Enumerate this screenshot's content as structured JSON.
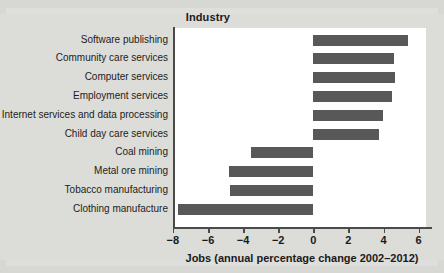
{
  "chart_data": {
    "type": "bar",
    "orientation": "horizontal",
    "title": "Industry",
    "xlabel": "Jobs (annual percentage change 2002–2012)",
    "ylabel": "Industry",
    "categories": [
      "Software publishing",
      "Community care services",
      "Computer services",
      "Employment services",
      "Internet services and data processing",
      "Child day care services",
      "Coal mining",
      "Metal ore mining",
      "Tobacco manufacturing",
      "Clothing manufacture"
    ],
    "values": [
      5.4,
      4.6,
      4.65,
      4.5,
      3.95,
      3.75,
      -3.55,
      -4.8,
      -4.75,
      -7.7
    ],
    "xlim": [
      -8.6,
      6.6
    ],
    "xticks": [
      -8,
      -6,
      -4,
      -2,
      0,
      2,
      4,
      6
    ],
    "xtick_labels": [
      "−8",
      "−6",
      "−4",
      "−2",
      "0",
      "2",
      "4",
      "6"
    ],
    "grid": false,
    "legend": false,
    "bar_color": "#585858",
    "plot_bg": "#ffffff",
    "page_bg": "#d7d7d4"
  }
}
